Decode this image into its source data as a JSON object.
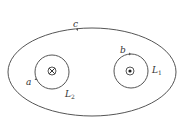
{
  "diagram": {
    "type": "magnetic field loops around two wires",
    "outer_loop": {
      "label": "c"
    },
    "left_circle": {
      "label": "a",
      "wire_label": "L",
      "wire_sub": "2",
      "current_direction": "into page (⊗)"
    },
    "right_circle": {
      "label": "b",
      "wire_label": "L",
      "wire_sub": "1",
      "current_direction": "out of page (⊙)"
    }
  }
}
